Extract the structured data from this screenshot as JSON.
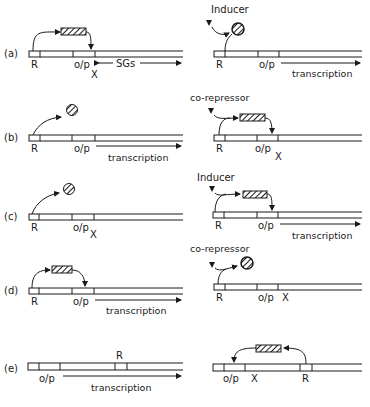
{
  "figure": {
    "panels": [
      {
        "id": "a",
        "label": "(a)",
        "left": {
          "gene_labels": {
            "regulator": "R",
            "operator_promoter": "o/p",
            "block": "X",
            "structural": "SGs"
          },
          "repressor_state": "active-bound",
          "effect": "no transcription"
        },
        "right": {
          "effector": "Inducer",
          "gene_labels": {
            "regulator": "R",
            "operator_promoter": "o/p"
          },
          "repressor_state": "inactivated",
          "output": "transcription"
        }
      },
      {
        "id": "b",
        "label": "(b)",
        "left": {
          "gene_labels": {
            "regulator": "R",
            "operator_promoter": "o/p"
          },
          "repressor_state": "inactive",
          "output": "transcription"
        },
        "right": {
          "effector": "co-repressor",
          "gene_labels": {
            "regulator": "R",
            "operator_promoter": "o/p",
            "block": "X"
          },
          "repressor_state": "activated-bound"
        }
      },
      {
        "id": "c",
        "label": "(c)",
        "left": {
          "gene_labels": {
            "regulator": "R",
            "operator_promoter": "o/p",
            "block": "X"
          },
          "repressor_state": "inactive"
        },
        "right": {
          "effector": "Inducer",
          "gene_labels": {
            "regulator": "R",
            "operator_promoter": "o/p"
          },
          "repressor_state": "activator-bound",
          "output": "transcription"
        }
      },
      {
        "id": "d",
        "label": "(d)",
        "left": {
          "gene_labels": {
            "regulator": "R",
            "operator_promoter": "o/p"
          },
          "repressor_state": "activator-bound",
          "output": "transcription"
        },
        "right": {
          "effector": "co-repressor",
          "gene_labels": {
            "regulator": "R",
            "operator_promoter": "o/p",
            "block": "X"
          },
          "repressor_state": "inactivated"
        }
      },
      {
        "id": "e",
        "label": "(e)",
        "left": {
          "gene_labels": {
            "regulator": "R",
            "operator_promoter": "o/p"
          },
          "output": "transcription"
        },
        "right": {
          "gene_labels": {
            "regulator": "R",
            "operator_promoter": "o/p",
            "block": "X"
          },
          "repressor_state": "active-bound"
        }
      }
    ]
  },
  "text": {
    "a": "(a)",
    "b": "(b)",
    "c": "(c)",
    "d": "(d)",
    "e": "(e)",
    "R": "R",
    "op": "o/p",
    "X": "X",
    "SGs": "SGs",
    "transcription": "transcription",
    "inducer": "Inducer",
    "corepressor": "co-repressor"
  },
  "colors": {
    "ink": "#1a1a1a",
    "paper": "#ffffff"
  }
}
